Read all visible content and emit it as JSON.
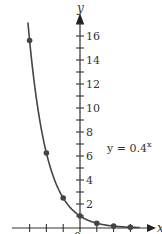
{
  "chart_data": {
    "type": "line",
    "title": "",
    "function_label": "y = 0.4",
    "function_exponent": "x",
    "xlabel": "x",
    "ylabel": "y",
    "origin_label": "0",
    "x": [
      -3,
      -2,
      -1,
      0,
      1,
      2,
      3
    ],
    "series": [
      {
        "name": "y = 0.4^x",
        "values": [
          15.625,
          6.25,
          2.5,
          1,
          0.4,
          0.16,
          0.064
        ]
      }
    ],
    "xlim": [
      -3.5,
      4
    ],
    "ylim": [
      0,
      17.5
    ],
    "x_ticks": [
      -3,
      -2,
      -1,
      1,
      2,
      3
    ],
    "y_ticks_minor": [
      1,
      3,
      5,
      7,
      9,
      11,
      13,
      15,
      17
    ],
    "y_tick_labels": [
      "2",
      "4",
      "6",
      "8",
      "10",
      "12",
      "14",
      "16"
    ],
    "y_tick_values": [
      2,
      4,
      6,
      8,
      10,
      12,
      14,
      16
    ],
    "grid": false,
    "legend": "none",
    "colors": {
      "curve": "#444444",
      "axis": "#333333",
      "point": "#444444"
    }
  }
}
